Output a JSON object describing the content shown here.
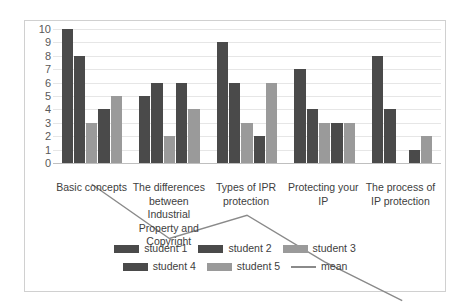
{
  "chart_data": {
    "type": "bar",
    "title": "",
    "xlabel": "",
    "ylabel": "",
    "ylim": [
      0,
      10
    ],
    "ytick_step": 1,
    "yticks": [
      10,
      9,
      8,
      7,
      6,
      5,
      4,
      3,
      2,
      1,
      0
    ],
    "grid": true,
    "legend_position": "bottom",
    "categories": [
      "Basic concepts",
      "The differences between Industrial Property and Copyright",
      "Types of IPR protection",
      "Protecting your IP",
      "The process of IP protection"
    ],
    "series": [
      {
        "name": "student 1",
        "type": "bar",
        "color": "#4a4a4a",
        "values": [
          10,
          5,
          9,
          7,
          8
        ]
      },
      {
        "name": "student 2",
        "type": "bar",
        "color": "#4a4a4a",
        "values": [
          8,
          6,
          6,
          4,
          4
        ]
      },
      {
        "name": "student 3",
        "type": "bar",
        "color": "#9a9a9a",
        "values": [
          3,
          2,
          3,
          3,
          0
        ]
      },
      {
        "name": "student 4",
        "type": "bar",
        "color": "#4a4a4a",
        "values": [
          4,
          6,
          2,
          3,
          1
        ]
      },
      {
        "name": "student 5",
        "type": "bar",
        "color": "#9a9a9a",
        "values": [
          5,
          4,
          6,
          3,
          2
        ]
      },
      {
        "name": "mean",
        "type": "line",
        "color": "#8a8a8a",
        "values": [
          6,
          4.6,
          5.2,
          4,
          3
        ]
      }
    ]
  },
  "legend": {
    "rows": [
      [
        {
          "label": "student 1",
          "marker": "bar-dark"
        },
        {
          "label": "student 2",
          "marker": "bar-dark"
        },
        {
          "label": "student 3",
          "marker": "bar-light"
        }
      ],
      [
        {
          "label": "student 4",
          "marker": "bar-dark"
        },
        {
          "label": "student 5",
          "marker": "bar-light"
        },
        {
          "label": "mean",
          "marker": "line"
        }
      ]
    ]
  },
  "colors": {
    "bar_dark": "#4a4a4a",
    "bar_light": "#9a9a9a",
    "mean_line": "#8a8a8a",
    "gridline": "#e6e6e6",
    "frame": "#d0d0d0",
    "text": "#404040",
    "axis_text": "#595959"
  }
}
